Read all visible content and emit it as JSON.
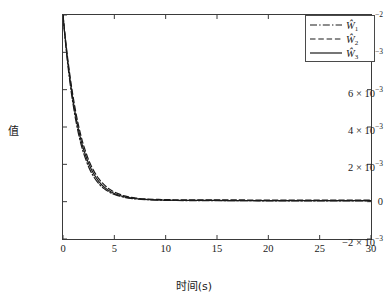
{
  "chart_data": {
    "type": "line",
    "title": "",
    "xlabel": "时间(s)",
    "ylabel": "值",
    "xlim": [
      0,
      30
    ],
    "ylim": [
      -0.002,
      0.01
    ],
    "grid": false,
    "legend_position": "upper right",
    "xticks": [
      {
        "value": 0,
        "label": "0"
      },
      {
        "value": 5,
        "label": "5"
      },
      {
        "value": 10,
        "label": "10"
      },
      {
        "value": 15,
        "label": "15"
      },
      {
        "value": 20,
        "label": "20"
      },
      {
        "value": 25,
        "label": "25"
      },
      {
        "value": 30,
        "label": "30"
      }
    ],
    "yticks": [
      {
        "value": -0.002,
        "mantissa": "−2 × 10",
        "exponent": "−3"
      },
      {
        "value": 0.0,
        "mantissa": "0",
        "exponent": ""
      },
      {
        "value": 0.002,
        "mantissa": "2 × 10",
        "exponent": "−3"
      },
      {
        "value": 0.004,
        "mantissa": "4 × 10",
        "exponent": "−3"
      },
      {
        "value": 0.006,
        "mantissa": "6 × 10",
        "exponent": "−3"
      },
      {
        "value": 0.008,
        "mantissa": "8 × 10",
        "exponent": "−3"
      },
      {
        "value": 0.01,
        "mantissa": "1 × 10",
        "exponent": "−2"
      }
    ],
    "series": [
      {
        "name": "Ŵ1",
        "label_base": "Ŵ",
        "label_sub": "1",
        "style": "dash-dot",
        "color": "#1a1a1a",
        "x": [
          0,
          0.15,
          0.3,
          0.45,
          0.6,
          0.8,
          1.0,
          1.25,
          1.5,
          1.75,
          2.0,
          2.5,
          3.0,
          3.5,
          4.0,
          4.5,
          5.0,
          6.0,
          7.0,
          8.0,
          10.0,
          12.0,
          14.0,
          16.0,
          18.0,
          20.0,
          22.0,
          24.0,
          26.0,
          28.0,
          30.0
        ],
        "y": [
          0.01,
          0.00905,
          0.0082,
          0.00742,
          0.00672,
          0.00588,
          0.00515,
          0.00434,
          0.00366,
          0.00309,
          0.00261,
          0.00186,
          0.00133,
          0.00096,
          0.0007,
          0.00052,
          0.00039,
          0.00023,
          0.00015,
          0.00011,
          7e-05,
          6e-05,
          5e-05,
          5e-05,
          5e-05,
          4e-05,
          4e-05,
          4e-05,
          4e-05,
          4e-05,
          4e-05
        ]
      },
      {
        "name": "Ŵ2",
        "label_base": "Ŵ",
        "label_sub": "2",
        "style": "dashed",
        "color": "#1a1a1a",
        "x": [
          0,
          0.15,
          0.3,
          0.45,
          0.6,
          0.8,
          1.0,
          1.25,
          1.5,
          1.75,
          2.0,
          2.5,
          3.0,
          3.5,
          4.0,
          4.5,
          5.0,
          6.0,
          7.0,
          8.0,
          10.0,
          12.0,
          14.0,
          16.0,
          18.0,
          20.0,
          22.0,
          24.0,
          26.0,
          28.0,
          30.0
        ],
        "y": [
          0.01,
          0.00918,
          0.00842,
          0.00771,
          0.00707,
          0.00628,
          0.00558,
          0.00479,
          0.00411,
          0.00353,
          0.00303,
          0.00223,
          0.00165,
          0.00122,
          0.00091,
          0.00068,
          0.00052,
          0.00031,
          0.0002,
          0.00015,
          0.00011,
          0.0001,
          0.0001,
          0.0001,
          9e-05,
          9e-05,
          9e-05,
          9e-05,
          9e-05,
          9e-05,
          9e-05
        ]
      },
      {
        "name": "Ŵ3",
        "label_base": "Ŵ",
        "label_sub": "3",
        "style": "solid",
        "color": "#1a1a1a",
        "x": [
          0,
          0.15,
          0.3,
          0.45,
          0.6,
          0.8,
          1.0,
          1.25,
          1.5,
          1.75,
          2.0,
          2.5,
          3.0,
          3.5,
          4.0,
          4.5,
          5.0,
          6.0,
          7.0,
          8.0,
          10.0,
          12.0,
          14.0,
          16.0,
          18.0,
          20.0,
          22.0,
          24.0,
          26.0,
          28.0,
          30.0
        ],
        "y": [
          0.01,
          0.00911,
          0.00831,
          0.00757,
          0.0069,
          0.00608,
          0.00536,
          0.00456,
          0.00388,
          0.0033,
          0.00281,
          0.00204,
          0.00148,
          0.00108,
          0.00079,
          0.00058,
          0.00044,
          0.00026,
          0.00017,
          0.00012,
          8e-05,
          7e-05,
          7e-05,
          6e-05,
          6e-05,
          6e-05,
          6e-05,
          6e-05,
          6e-05,
          6e-05,
          6e-05
        ]
      }
    ]
  }
}
